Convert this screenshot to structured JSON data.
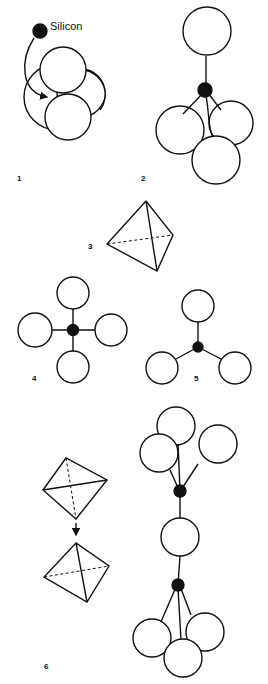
{
  "figure": {
    "annotation": "Silicon",
    "panels": [
      {
        "id": 1,
        "label": "1",
        "description": "Silicon atom moving into the gap between four packed oxygen spheres"
      },
      {
        "id": 2,
        "label": "2",
        "description": "Silicon at centre bonded to four oxygens (tetrahedral arrangement)"
      },
      {
        "id": 3,
        "label": "3",
        "description": "Tetrahedron shape"
      },
      {
        "id": 4,
        "label": "4",
        "description": "Plan view: silicon with four oxygens"
      },
      {
        "id": 5,
        "label": "5",
        "description": "Silicon with three visible oxygens"
      },
      {
        "id": 6,
        "label": "6",
        "description": "Two tetrahedra linked by a shared oxygen"
      }
    ]
  },
  "colors": {
    "ink": "#111111",
    "background": "#ffffff"
  }
}
